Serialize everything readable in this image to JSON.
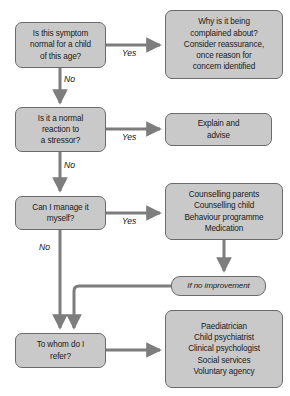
{
  "diagram": {
    "background_color": "#ffffff",
    "node_fill": "#c9c9c9",
    "node_border": "#6a6a6a",
    "connector_color": "#7d7d7d"
  },
  "nodes": {
    "q1": "Is this symptom\nnormal for a child\nof this age?",
    "q1_line1": "Is this symptom",
    "q1_line2": "normal for a child",
    "q1_line3": "of this age?",
    "r1_line1": "Why is it being",
    "r1_line2": "complained about?",
    "r1_line3": "Consider reassurance,",
    "r1_line4": "once reason for",
    "r1_line5": "concern identified",
    "q2_line1": "Is it a normal",
    "q2_line2": "reaction to",
    "q2_line3": "a stressor?",
    "r2_line1": "Explain and",
    "r2_line2": "advise",
    "q3_line1": "Can I manage it",
    "q3_line2": "myself?",
    "r3_line1": "Counselling parents",
    "r3_line2": "Counselling child",
    "r3_line3": "Behaviour programme",
    "r3_line4": "Medication",
    "improve": "If no improvement",
    "q4_line1": "To whom do I",
    "q4_line2": "refer?",
    "r4_line1": "Paediatrician",
    "r4_line2": "Child psychiatrist",
    "r4_line3": "Clinical psychologist",
    "r4_line4": "Social services",
    "r4_line5": "Voluntary agency"
  },
  "edge_labels": {
    "yes1": "Yes",
    "no1": "No",
    "yes2": "Yes",
    "no2": "No",
    "yes3": "Yes",
    "no3": "No",
    "yes4": "Yes"
  }
}
